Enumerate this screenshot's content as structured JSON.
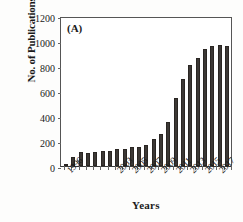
{
  "chart_data": {
    "type": "bar",
    "title": "",
    "panel_label": "(A)",
    "xlabel": "Years",
    "ylabel": "No. of Publications",
    "ylim": [
      0,
      1200
    ],
    "yticks": [
      0,
      200,
      400,
      600,
      800,
      1000,
      1200
    ],
    "grid": false,
    "legend": "none",
    "xtick_labels": [
      "1996",
      "2003",
      "2005",
      "2007",
      "2009",
      "2011",
      "2013",
      "2015",
      "2017"
    ],
    "xtick_rotation": -45,
    "bar_color": "#3c3835",
    "categories": [
      "1996",
      "1997",
      "1998",
      "1999",
      "2000",
      "2001",
      "2002",
      "2003",
      "2004",
      "2005",
      "2006",
      "2007",
      "2008",
      "2009",
      "2010",
      "2011",
      "2012",
      "2013",
      "2014",
      "2015",
      "2016",
      "2017",
      "2018"
    ],
    "values": [
      20,
      75,
      110,
      108,
      110,
      120,
      118,
      140,
      138,
      152,
      150,
      172,
      215,
      258,
      350,
      548,
      693,
      808,
      868,
      938,
      963,
      965,
      962
    ]
  },
  "axes": {
    "y_title": "No. of Publications",
    "x_title": "Years"
  }
}
